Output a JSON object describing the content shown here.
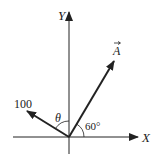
{
  "diagram": {
    "type": "vector-diagram",
    "axes": {
      "x_label": "X",
      "y_label": "Y"
    },
    "vectors": [
      {
        "name": "A",
        "label": "A",
        "has_arrow_over_label": true,
        "angle_label": "60°",
        "angle_from": "X-axis"
      },
      {
        "name": "force-100",
        "label": "100",
        "angle_label": "θ",
        "angle_from": "Y-axis"
      }
    ],
    "colors": {
      "stroke": "#222222",
      "background": "#ffffff"
    }
  }
}
